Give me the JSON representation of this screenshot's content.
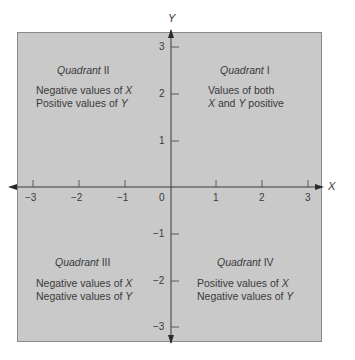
{
  "diagram": {
    "axes": {
      "x_label": "X",
      "y_label": "Y",
      "x_ticks": [
        "−3",
        "−2",
        "−1",
        "0",
        "1",
        "2",
        "3"
      ],
      "y_ticks": [
        "3",
        "2",
        "1",
        "−1",
        "−2",
        "−3"
      ]
    },
    "quadrants": {
      "q1": {
        "title_word": "Quadrant",
        "numeral": "I",
        "line1": "Values of both",
        "line2_a": "X",
        "line2_b": " and ",
        "line2_c": "Y",
        "line2_d": " positive"
      },
      "q2": {
        "title_word": "Quadrant",
        "numeral": "II",
        "line1_a": "Negative values of ",
        "line1_b": "X",
        "line2_a": "Positive values of ",
        "line2_b": "Y"
      },
      "q3": {
        "title_word": "Quadrant",
        "numeral": "III",
        "line1_a": "Negative values of ",
        "line1_b": "X",
        "line2_a": "Negative values of ",
        "line2_b": "Y"
      },
      "q4": {
        "title_word": "Quadrant",
        "numeral": "IV",
        "line1_a": "Positive values of ",
        "line1_b": "X",
        "line2_a": "Negative values of ",
        "line2_b": "Y"
      }
    },
    "colors": {
      "plot_background": "#c9c9c9",
      "axis_line": "#3a3a3a",
      "border": "#8a8a8a"
    }
  }
}
